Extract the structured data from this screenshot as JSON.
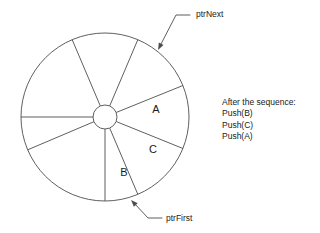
{
  "diagram": {
    "geometry": {
      "center_x": 105,
      "center_y": 117,
      "outer_radius": 84,
      "hub_radius": 12,
      "slot_count": 8,
      "stroke_color": "#4d4d4d",
      "background_color": "#ffffff"
    },
    "spoke_angles_deg": [
      -113,
      -67,
      -22,
      22,
      67,
      90,
      157,
      180
    ],
    "slots": [
      {
        "id": "slot-a",
        "label": "A",
        "x": 156,
        "y": 110
      },
      {
        "id": "slot-c",
        "label": "C",
        "x": 153,
        "y": 150
      },
      {
        "id": "slot-b",
        "label": "B",
        "x": 124,
        "y": 173
      }
    ],
    "pointers": [
      {
        "id": "ptr-next",
        "label": "ptrNext",
        "label_x": 196,
        "label_y": 10,
        "leader": "M 190 15 L 176 15 L 160 46",
        "arrow_tip_x": 158,
        "arrow_tip_y": 50
      },
      {
        "id": "ptr-first",
        "label": "ptrFirst",
        "label_x": 166,
        "label_y": 214,
        "leader": "M 162 218 L 148 218 L 134 203",
        "arrow_tip_x": 131,
        "arrow_tip_y": 200
      }
    ]
  },
  "notes": {
    "heading": "After the sequence:",
    "operations": [
      "Push(B)",
      "Push(C)",
      "Push(A)"
    ]
  }
}
